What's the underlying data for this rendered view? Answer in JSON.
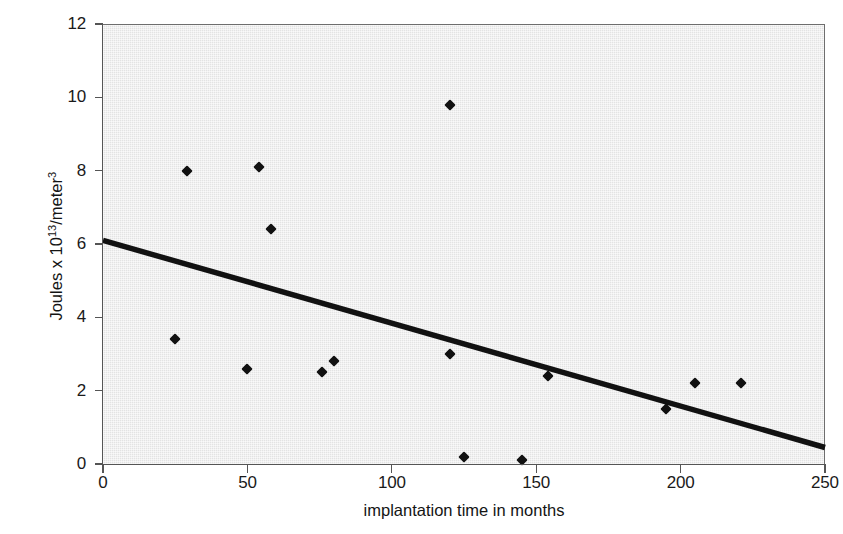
{
  "chart_data": {
    "type": "scatter",
    "title": "",
    "xlabel": "implantation time in months",
    "ylabel": "Joules x 10¹³/meter³",
    "ylabel_parts": {
      "prefix": "Joules x 10",
      "exp1": "13",
      "middle": "/meter",
      "exp2": "3"
    },
    "xlim": [
      0,
      250
    ],
    "ylim": [
      0,
      12
    ],
    "xticks": [
      0,
      50,
      100,
      150,
      200,
      250
    ],
    "yticks": [
      0,
      2,
      4,
      6,
      8,
      10,
      12
    ],
    "xtick_labels": [
      "0",
      "50",
      "100",
      "150",
      "200",
      "250"
    ],
    "ytick_labels": [
      "0",
      "2",
      "4",
      "6",
      "8",
      "10",
      "12"
    ],
    "grid": false,
    "legend": "none",
    "plot_background_color": "#e3e3e3",
    "marker_color": "#111111",
    "marker_shape": "diamond",
    "trendline_color": "#111111",
    "points": [
      {
        "x": 25,
        "y": 3.4
      },
      {
        "x": 29,
        "y": 8.0
      },
      {
        "x": 50,
        "y": 2.6
      },
      {
        "x": 54,
        "y": 8.1
      },
      {
        "x": 58,
        "y": 6.4
      },
      {
        "x": 76,
        "y": 2.5
      },
      {
        "x": 80,
        "y": 2.8
      },
      {
        "x": 120,
        "y": 9.8
      },
      {
        "x": 120,
        "y": 3.0
      },
      {
        "x": 125,
        "y": 0.2
      },
      {
        "x": 145,
        "y": 0.1
      },
      {
        "x": 154,
        "y": 2.4
      },
      {
        "x": 195,
        "y": 1.5
      },
      {
        "x": 205,
        "y": 2.2
      },
      {
        "x": 221,
        "y": 2.2
      }
    ],
    "trendline": {
      "x0": 0,
      "y0": 6.1,
      "x1": 250,
      "y1": 0.45
    }
  }
}
